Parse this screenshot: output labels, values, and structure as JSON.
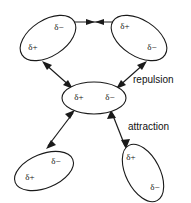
{
  "figure": {
    "background_color": "#ffffff",
    "stroke_color": "#1a1a1a",
    "text_color": "#111111",
    "width": 191,
    "height": 203
  },
  "labels": {
    "repulsion": "repulsion",
    "attraction": "attraction"
  },
  "charges": {
    "delta_plus": "δ+",
    "delta_minus": "δ−"
  },
  "dipoles": [
    {
      "id": "top-left",
      "cx": 48,
      "cy": 38,
      "rx": 31,
      "ry": 18,
      "rotation": -33,
      "positive": {
        "label": "δ+",
        "x": 33,
        "y": 48
      },
      "negative": {
        "label": "δ−",
        "x": 59,
        "y": 28
      }
    },
    {
      "id": "top-right",
      "cx": 139,
      "cy": 38,
      "rx": 31,
      "ry": 18,
      "rotation": 33,
      "positive": {
        "label": "δ+",
        "x": 125,
        "y": 27
      },
      "negative": {
        "label": "δ−",
        "x": 152,
        "y": 48
      }
    },
    {
      "id": "center",
      "cx": 94,
      "cy": 98,
      "rx": 32,
      "ry": 16,
      "rotation": 0,
      "positive": {
        "label": "δ+",
        "x": 79,
        "y": 98
      },
      "negative": {
        "label": "δ−",
        "x": 110,
        "y": 98
      }
    },
    {
      "id": "bottom-left",
      "cx": 44,
      "cy": 171,
      "rx": 31,
      "ry": 17,
      "rotation": -22,
      "positive": {
        "label": "δ+",
        "x": 30,
        "y": 178
      },
      "negative": {
        "label": "δ−",
        "x": 56,
        "y": 162
      }
    },
    {
      "id": "bottom-right",
      "cx": 143,
      "cy": 173,
      "rx": 31,
      "ry": 17,
      "rotation": 63,
      "positive": {
        "label": "δ+",
        "x": 131,
        "y": 158
      },
      "negative": {
        "label": "δ−",
        "x": 155,
        "y": 188
      }
    }
  ],
  "forces": [
    {
      "id": "top-pair",
      "kind": "repulsion",
      "x1": 73,
      "y1": 22,
      "x2": 117,
      "y2": 22,
      "heads": "both-inward"
    },
    {
      "id": "center-to-top-left",
      "kind": "repulsion",
      "x1": 44,
      "y1": 63,
      "x2": 71,
      "y2": 87,
      "heads": "both-outward"
    },
    {
      "id": "center-to-top-right",
      "kind": "repulsion",
      "x1": 145,
      "y1": 63,
      "x2": 118,
      "y2": 87,
      "heads": "both-outward"
    },
    {
      "id": "center-to-bottom-left",
      "kind": "attraction",
      "x1": 48,
      "y1": 146,
      "x2": 73,
      "y2": 113,
      "heads": "both-outward"
    },
    {
      "id": "center-to-bottom-right",
      "kind": "attraction",
      "x1": 125,
      "y1": 146,
      "x2": 112,
      "y2": 113,
      "heads": "both-outward"
    }
  ],
  "annotations": [
    {
      "id": "repulsion-label",
      "text": "repulsion",
      "x": 133,
      "y": 80
    },
    {
      "id": "attraction-label",
      "text": "attraction",
      "x": 128,
      "y": 127
    }
  ]
}
